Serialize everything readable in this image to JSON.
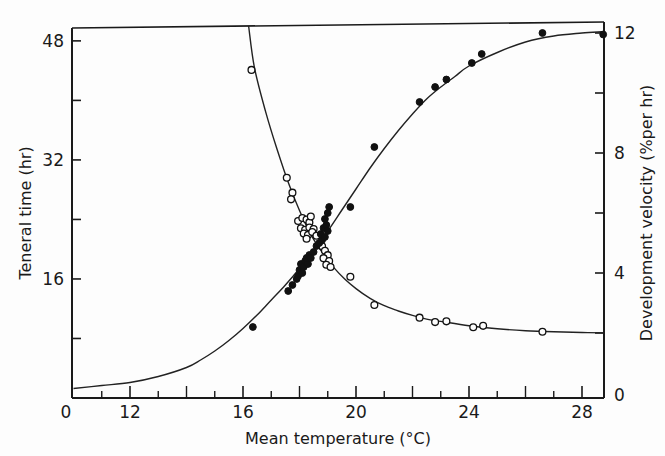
{
  "chart_data": {
    "type": "scatter",
    "title": "",
    "xlabel": "Mean temperature (°C)",
    "ylabel_left": "Teneral time (hr)",
    "ylabel_right": "Development velocity (%per hr)",
    "x_axis": {
      "range": [
        10,
        28.8
      ],
      "break_label": "0",
      "ticks": [
        {
          "value": 12,
          "label": "12"
        },
        {
          "value": 16,
          "label": "16"
        },
        {
          "value": 20,
          "label": "20"
        },
        {
          "value": 24,
          "label": "24"
        },
        {
          "value": 28,
          "label": "28"
        }
      ],
      "minor_ticks": [
        11,
        13,
        14,
        15,
        17,
        18,
        19,
        21,
        22,
        23,
        25,
        26,
        27
      ]
    },
    "y_left_axis": {
      "range": [
        0,
        50
      ],
      "ticks": [
        {
          "value": 0,
          "label": "0"
        },
        {
          "value": 16,
          "label": "16"
        },
        {
          "value": 32,
          "label": "32"
        },
        {
          "value": 48,
          "label": "48"
        }
      ],
      "minor_ticks": [
        8,
        24,
        40
      ]
    },
    "y_right_axis": {
      "range": [
        0,
        12.3
      ],
      "ticks": [
        {
          "value": 0,
          "label": "0"
        },
        {
          "value": 4,
          "label": "4"
        },
        {
          "value": 8,
          "label": "8"
        },
        {
          "value": 12,
          "label": "12"
        }
      ],
      "minor_ticks": [
        2,
        6,
        10
      ]
    },
    "grid": false,
    "legend": null,
    "series": [
      {
        "name": "Teneral time",
        "axis": "left",
        "marker": "open-circle",
        "points": [
          [
            16.3,
            44.1
          ],
          [
            17.55,
            29.6
          ],
          [
            17.75,
            27.6
          ],
          [
            17.7,
            26.7
          ],
          [
            17.95,
            23.8
          ],
          [
            18.1,
            24.2
          ],
          [
            18.25,
            24.0
          ],
          [
            18.35,
            23.6
          ],
          [
            18.4,
            24.4
          ],
          [
            18.05,
            22.8
          ],
          [
            18.2,
            22.6
          ],
          [
            18.35,
            22.9
          ],
          [
            18.5,
            22.7
          ],
          [
            18.15,
            22.1
          ],
          [
            18.3,
            21.9
          ],
          [
            18.45,
            22.3
          ],
          [
            18.6,
            21.8
          ],
          [
            18.25,
            21.4
          ],
          [
            18.8,
            20.4
          ],
          [
            18.9,
            19.8
          ],
          [
            19.0,
            19.2
          ],
          [
            18.85,
            18.8
          ],
          [
            19.05,
            18.4
          ],
          [
            18.95,
            17.9
          ],
          [
            19.1,
            17.6
          ],
          [
            19.8,
            16.3
          ],
          [
            20.65,
            12.5
          ],
          [
            22.25,
            10.8
          ],
          [
            22.8,
            10.2
          ],
          [
            23.2,
            10.3
          ],
          [
            24.15,
            9.5
          ],
          [
            24.5,
            9.7
          ],
          [
            26.6,
            8.9
          ]
        ],
        "fit_curve": [
          [
            16.2,
            50
          ],
          [
            16.4,
            44.5
          ],
          [
            16.8,
            38.5
          ],
          [
            17.2,
            33.5
          ],
          [
            17.6,
            29.0
          ],
          [
            18.0,
            25.2
          ],
          [
            18.4,
            22.0
          ],
          [
            18.8,
            19.6
          ],
          [
            19.2,
            17.6
          ],
          [
            19.6,
            16.0
          ],
          [
            20.0,
            14.7
          ],
          [
            20.5,
            13.4
          ],
          [
            21.0,
            12.4
          ],
          [
            21.5,
            11.7
          ],
          [
            22.0,
            11.1
          ],
          [
            22.5,
            10.6
          ],
          [
            23.0,
            10.3
          ],
          [
            24.0,
            9.7
          ],
          [
            25.0,
            9.3
          ],
          [
            26.0,
            9.05
          ],
          [
            27.0,
            8.9
          ],
          [
            28.0,
            8.8
          ],
          [
            28.8,
            8.75
          ]
        ]
      },
      {
        "name": "Development velocity",
        "axis": "right",
        "marker": "filled-circle",
        "points": [
          [
            16.35,
            2.2
          ],
          [
            17.6,
            3.4
          ],
          [
            17.75,
            3.6
          ],
          [
            17.9,
            3.8
          ],
          [
            17.95,
            3.9
          ],
          [
            18.0,
            4.1
          ],
          [
            18.1,
            4.0
          ],
          [
            18.05,
            4.3
          ],
          [
            18.15,
            4.2
          ],
          [
            18.2,
            4.4
          ],
          [
            18.3,
            4.3
          ],
          [
            18.25,
            4.5
          ],
          [
            18.35,
            4.6
          ],
          [
            18.4,
            4.5
          ],
          [
            18.5,
            4.7
          ],
          [
            18.6,
            4.9
          ],
          [
            18.7,
            5.0
          ],
          [
            18.8,
            5.1
          ],
          [
            18.75,
            5.3
          ],
          [
            18.9,
            5.2
          ],
          [
            18.85,
            5.5
          ],
          [
            18.95,
            5.6
          ],
          [
            19.0,
            5.4
          ],
          [
            18.9,
            5.8
          ],
          [
            19.0,
            6.0
          ],
          [
            19.05,
            6.2
          ],
          [
            19.8,
            6.2
          ],
          [
            20.65,
            8.2
          ],
          [
            22.25,
            9.7
          ],
          [
            22.8,
            10.2
          ],
          [
            23.2,
            10.45
          ],
          [
            24.1,
            11.0
          ],
          [
            24.45,
            11.3
          ],
          [
            26.6,
            12.0
          ],
          [
            28.75,
            11.95
          ]
        ],
        "fit_curve": [
          [
            10.0,
            0.15
          ],
          [
            11.0,
            0.25
          ],
          [
            12.0,
            0.35
          ],
          [
            13.0,
            0.55
          ],
          [
            14.0,
            0.85
          ],
          [
            14.5,
            1.1
          ],
          [
            15.0,
            1.4
          ],
          [
            15.5,
            1.75
          ],
          [
            16.0,
            2.15
          ],
          [
            16.5,
            2.6
          ],
          [
            17.0,
            3.1
          ],
          [
            17.5,
            3.6
          ],
          [
            18.0,
            4.15
          ],
          [
            18.5,
            4.75
          ],
          [
            19.0,
            5.4
          ],
          [
            19.5,
            6.1
          ],
          [
            20.0,
            6.8
          ],
          [
            20.5,
            7.5
          ],
          [
            21.0,
            8.15
          ],
          [
            21.5,
            8.75
          ],
          [
            22.0,
            9.3
          ],
          [
            22.5,
            9.8
          ],
          [
            23.0,
            10.2
          ],
          [
            23.5,
            10.55
          ],
          [
            24.0,
            10.9
          ],
          [
            25.0,
            11.35
          ],
          [
            26.0,
            11.7
          ],
          [
            27.0,
            11.9
          ],
          [
            28.0,
            12.0
          ],
          [
            28.8,
            12.05
          ]
        ]
      }
    ]
  }
}
